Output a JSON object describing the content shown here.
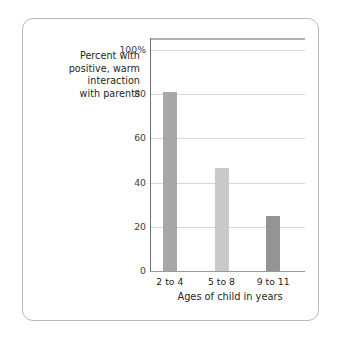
{
  "chart_data": {
    "type": "bar",
    "title": "",
    "subtitle": "",
    "categories": [
      "2 to 4",
      "5 to 8",
      "9 to 11"
    ],
    "values": [
      81,
      46.5,
      25
    ],
    "series": [
      {
        "name": "Percent with positive, warm interaction with parents",
        "values": [
          81,
          46.5,
          25
        ]
      }
    ],
    "xlabel": "Ages of child in years",
    "ylabel": "Percent with positive, warm interaction with parents",
    "ylim": [
      0,
      100
    ],
    "yticks": [
      0,
      20,
      40,
      60,
      80,
      100
    ],
    "ytick_labels": [
      "0",
      "20",
      "40",
      "60",
      "80",
      "100%"
    ],
    "grid": "horizontal",
    "legend": "none",
    "bar_colors": [
      "#a8a8a8",
      "#c9c9c9",
      "#949494"
    ]
  },
  "axes": {
    "y_caption_lines": [
      "Percent with",
      "positive, warm",
      "interaction",
      "with parents"
    ],
    "x_title": "Ages of child in years"
  },
  "colors": {
    "card_border": "#b9b9b9",
    "gridline": "#d6d6d6",
    "y_spine": "#6f6f6f",
    "x_spine": "#9a9a9a",
    "top_rule": "#b0b0b0",
    "text": "#231f20",
    "tick_text": "#3d3d3d",
    "background": "#ffffff"
  }
}
